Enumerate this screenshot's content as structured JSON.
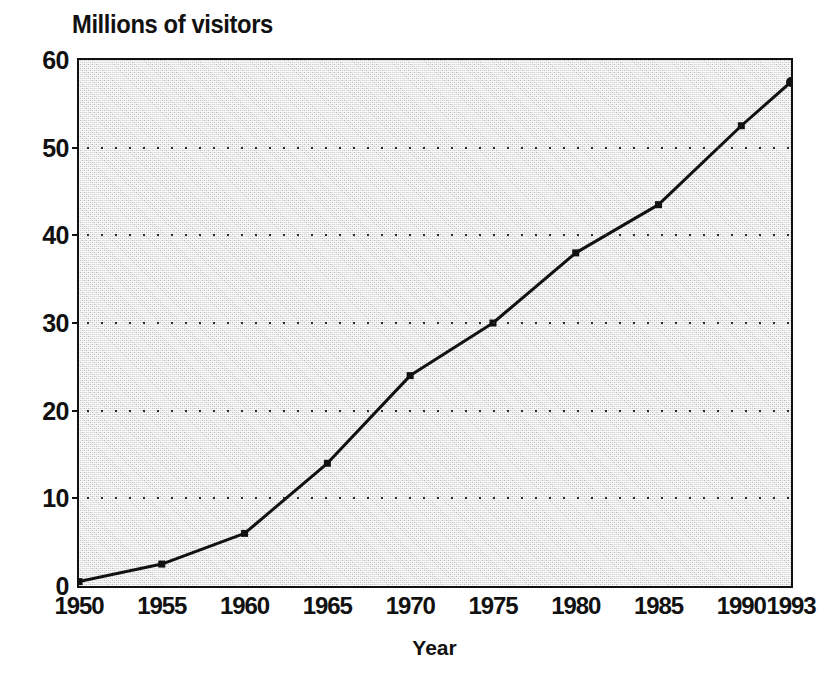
{
  "chart_data": {
    "type": "line",
    "title": "Millions of visitors",
    "xlabel": "Year",
    "ylabel": "",
    "x": [
      1950,
      1955,
      1960,
      1965,
      1970,
      1975,
      1980,
      1985,
      1990,
      1993
    ],
    "values": [
      0.5,
      2.5,
      6.0,
      14.0,
      24.0,
      30.0,
      38.0,
      43.5,
      52.5,
      57.5
    ],
    "series": [
      {
        "name": "Millions of visitors",
        "values": [
          0.5,
          2.5,
          6.0,
          14.0,
          24.0,
          30.0,
          38.0,
          43.5,
          52.5,
          57.5
        ]
      }
    ],
    "xtick_labels": [
      "1950",
      "1955",
      "1960",
      "1965",
      "1970",
      "1975",
      "1980",
      "1985",
      "1990",
      "1993"
    ],
    "xtick_positions": [
      1950,
      1955,
      1960,
      1965,
      1970,
      1975,
      1980,
      1985,
      1990,
      1993
    ],
    "ytick_labels": [
      "0",
      "10",
      "20",
      "30",
      "40",
      "50",
      "60"
    ],
    "ytick_values": [
      0,
      10,
      20,
      30,
      40,
      50,
      60
    ],
    "ylim": [
      0,
      60
    ],
    "xlim": [
      1950,
      1993
    ],
    "grid": "horizontal-dotted",
    "gridline_values": [
      10,
      20,
      30,
      40,
      50
    ],
    "legend": "none",
    "markers": "square",
    "plot_background": "#d9d9d9",
    "line_color": "#111111",
    "frame_color": "#111111",
    "page_background": "#ffffff"
  }
}
